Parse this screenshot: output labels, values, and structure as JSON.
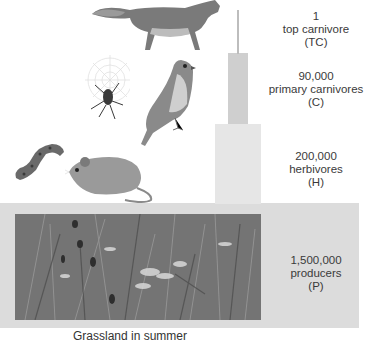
{
  "caption": "Grassland in summer",
  "levels": [
    {
      "count": "1",
      "name": "top carnivore",
      "abbr": "(TC)",
      "organisms": [
        "fox"
      ]
    },
    {
      "count": "90,000",
      "name": "primary carnivores",
      "abbr": "(C)",
      "organisms": [
        "spider",
        "kestrel"
      ]
    },
    {
      "count": "200,000",
      "name": "herbivores",
      "abbr": "(H)",
      "organisms": [
        "caterpillar",
        "mouse"
      ]
    },
    {
      "count": "1,500,000",
      "name": "producers",
      "abbr": "(P)",
      "organisms": [
        "grassland plants"
      ]
    }
  ],
  "colors": {
    "tc_bar": "#bdbdbd",
    "c_bar": "#cfcfcf",
    "h_bar": "#e6e6e6",
    "p_bar": "#dcdcdc",
    "text": "#3a3a3a"
  }
}
